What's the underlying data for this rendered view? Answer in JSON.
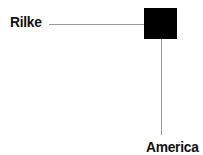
{
  "diagram": {
    "nodes": [
      {
        "id": "rilke",
        "label": "Rilke"
      },
      {
        "id": "america",
        "label": "America"
      }
    ],
    "center_marker": {
      "shape": "square",
      "color": "#000000"
    },
    "line_color": "#9a9a9a",
    "connections": [
      {
        "from": "rilke",
        "to": "center_marker",
        "direction": "horizontal"
      },
      {
        "from": "center_marker",
        "to": "america",
        "direction": "vertical"
      }
    ]
  }
}
